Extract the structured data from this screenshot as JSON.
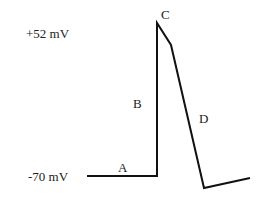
{
  "diagram": {
    "type": "action-potential",
    "axis_labels": {
      "top": "+52 mV",
      "bottom": "-70 mV"
    },
    "phase_labels": {
      "A": "A",
      "B": "B",
      "C": "C",
      "D": "D"
    },
    "line_color": "#111111",
    "text_color": "#222222"
  }
}
